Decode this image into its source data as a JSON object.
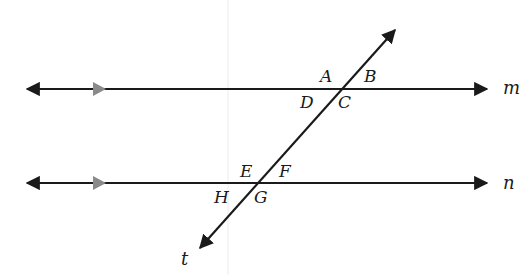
{
  "diagram": {
    "type": "parallel-lines-cut-by-transversal",
    "colors": {
      "line": "#1a1a1a",
      "parallel_marker": "#8a8a8a",
      "background": "#ffffff",
      "faint_guide": "#e6e6e6"
    },
    "lines": [
      {
        "id": "m",
        "label": "m",
        "y": 89,
        "x_start": 21,
        "x_end": 493,
        "parallel_marker_x": 105
      },
      {
        "id": "n",
        "label": "n",
        "y": 183,
        "x_start": 21,
        "x_end": 493,
        "parallel_marker_x": 105
      },
      {
        "id": "t",
        "label": "t",
        "x1": 399,
        "y1": 25,
        "x2": 196,
        "y2": 252
      }
    ],
    "intersections": [
      {
        "on": "m",
        "x": 342,
        "y": 89
      },
      {
        "on": "n",
        "x": 259,
        "y": 183
      }
    ],
    "angle_labels": {
      "A": "A",
      "B": "B",
      "C": "C",
      "D": "D",
      "E": "E",
      "F": "F",
      "G": "G",
      "H": "H"
    },
    "line_labels": {
      "m": "m",
      "n": "n",
      "t": "t"
    }
  }
}
